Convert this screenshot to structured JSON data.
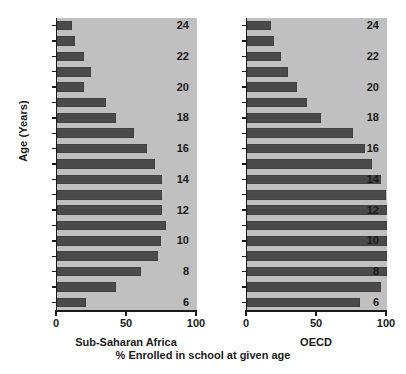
{
  "figure": {
    "caption": "% Enrolled in school at given age",
    "ylabel": "Age (Years)"
  },
  "axis": {
    "xticks": [
      "0",
      "50",
      "100"
    ],
    "xtick_values": [
      0,
      50,
      100
    ],
    "yticks_labeled": [
      "24",
      "22",
      "20",
      "18",
      "16",
      "14",
      "12",
      "10",
      "8",
      "6"
    ]
  },
  "colors": {
    "plot_background": "#c0c0c0",
    "bar_fill": "#4a4a4a",
    "axis": "#1a1a1a",
    "page_background": "#ffffff"
  },
  "chart_data": {
    "type": "bar",
    "orientation": "horizontal",
    "title": "",
    "xlabel": "% Enrolled in school at given age",
    "ylabel": "Age (Years)",
    "xlim": [
      0,
      100
    ],
    "ylim": [
      5.5,
      24.5
    ],
    "grid": false,
    "legend": "none",
    "panels": [
      {
        "name": "Sub-Saharan Africa",
        "label": "Sub-Saharan Africa",
        "categories": [
          24,
          23,
          22,
          21,
          20,
          19,
          18,
          17,
          16,
          15,
          14,
          13,
          12,
          11,
          10,
          9,
          8,
          7,
          6
        ],
        "values": [
          11,
          13,
          19,
          24,
          19,
          35,
          42,
          55,
          64,
          70,
          75,
          75,
          75,
          78,
          74,
          72,
          60,
          42,
          21
        ]
      },
      {
        "name": "OECD",
        "label": "OECD",
        "categories": [
          24,
          23,
          22,
          21,
          20,
          19,
          18,
          17,
          16,
          15,
          14,
          13,
          12,
          11,
          10,
          9,
          8,
          7,
          6
        ],
        "values": [
          17,
          19,
          24,
          29,
          36,
          43,
          53,
          76,
          84,
          89,
          96,
          99,
          100,
          100,
          100,
          100,
          100,
          96,
          81
        ]
      }
    ]
  }
}
